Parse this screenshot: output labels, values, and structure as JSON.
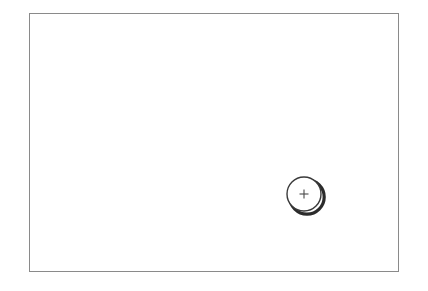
{
  "scene": {
    "title": "Blank framed canvas with single circular point marker",
    "background_color": "#ffffff",
    "width": 428,
    "height": 291
  },
  "frame": {
    "name": "canvas-frame",
    "border_color": "#8a8a8a",
    "border_width": 1,
    "fill_color": "#ffffff",
    "x": 29,
    "y": 13,
    "width": 370,
    "height": 259
  },
  "marker": {
    "name": "point-marker",
    "icon": "circle-plus-icon",
    "center_x": 304,
    "center_y": 194,
    "radius": 17,
    "outline_color": "#3a3a3a",
    "outline_width": 1.4,
    "fill_color": "#ffffff",
    "shadow_color": "#2b2b2b",
    "shadow_offset_x": 3,
    "shadow_offset_y": 3,
    "crosshair": {
      "name": "plus-crosshair-icon",
      "color": "#4a4a4a",
      "arm_length": 4.5,
      "stroke_width": 1.1
    }
  },
  "labels": {
    "frame_label": "",
    "marker_label": ""
  }
}
